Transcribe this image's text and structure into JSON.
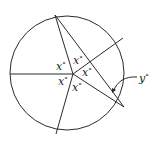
{
  "diagram": {
    "type": "circle-with-chords",
    "stroke_color": "#2a2a2a",
    "labels": {
      "x_upper_left": "x",
      "x_upper_right": "x",
      "x_right": "x",
      "x_lower_left": "x",
      "x_lower_right": "x",
      "y": "y",
      "degree": "°"
    }
  }
}
